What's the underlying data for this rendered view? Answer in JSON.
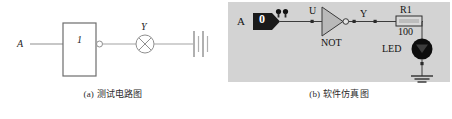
{
  "figure": {
    "panels": [
      {
        "id": "panel-a",
        "caption": "(a) 测试电路图",
        "background": "#ffffff",
        "line_color": "#8a8a8a",
        "labels": {
          "input": "A",
          "gate_symbol": "1",
          "lamp": "Y"
        },
        "components": [
          {
            "name": "input-node-label",
            "type": "text",
            "value": "A"
          },
          {
            "name": "inverter-box",
            "type": "rect-gate",
            "value": "1"
          },
          {
            "name": "inverter-bubble",
            "type": "bubble",
            "value": ""
          },
          {
            "name": "lamp",
            "type": "lamp-x-circle",
            "value": "Y"
          },
          {
            "name": "battery",
            "type": "battery",
            "value": ""
          }
        ]
      },
      {
        "id": "panel-b",
        "caption": "(b) 软件仿真图",
        "background": "#d2d2d2",
        "line_color": "#3c3c3c",
        "labels": {
          "input": "A",
          "switch_state": "0",
          "gate_input_net": "U",
          "gate_name": "NOT",
          "gate_output_net": "Y",
          "resistor_ref": "R1",
          "resistor_value": "100",
          "led": "LED"
        },
        "components": [
          {
            "name": "input-node-label",
            "type": "text",
            "value": "A"
          },
          {
            "name": "logic-switch",
            "type": "switch-pentagon",
            "value": "0"
          },
          {
            "name": "probe-indicator-1",
            "type": "probe",
            "value": ""
          },
          {
            "name": "probe-indicator-2",
            "type": "probe",
            "value": ""
          },
          {
            "name": "not-gate",
            "type": "triangle-gate",
            "value": "NOT"
          },
          {
            "name": "resistor",
            "type": "resistor",
            "value": "R1",
            "rating": "100"
          },
          {
            "name": "led",
            "type": "led",
            "value": "LED"
          },
          {
            "name": "ground",
            "type": "ground",
            "value": ""
          }
        ]
      }
    ]
  }
}
